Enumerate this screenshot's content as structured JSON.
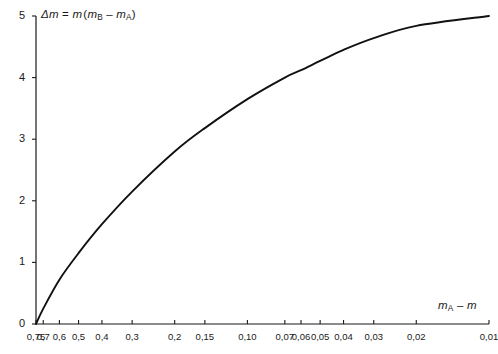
{
  "chart_data": {
    "type": "line",
    "title": "",
    "ylabel": "Δm = m (mB − mA)",
    "xlabel": "mA − m",
    "xscale": "log",
    "x_reversed": true,
    "xlim": [
      0.75,
      0.01
    ],
    "ylim": [
      0,
      5
    ],
    "grid": false,
    "legend": null,
    "xtick_labels": [
      "0,75",
      "0,7",
      "0,6",
      "0,5",
      "0,4",
      "0,3",
      "0,2",
      "0,15",
      "0,10",
      "0,07",
      "0,06",
      "0,05",
      "0,04",
      "0,03",
      "0,02",
      "0,01"
    ],
    "xtick_values": [
      0.75,
      0.7,
      0.6,
      0.5,
      0.4,
      0.3,
      0.2,
      0.15,
      0.1,
      0.07,
      0.06,
      0.05,
      0.04,
      0.03,
      0.02,
      0.01
    ],
    "ytick_labels": [
      "0",
      "1",
      "2",
      "3",
      "4",
      "5"
    ],
    "ytick_values": [
      0,
      1,
      2,
      3,
      4,
      5
    ],
    "series": [
      {
        "name": "Δm",
        "color": "#111111",
        "x": [
          0.75,
          0.7,
          0.6,
          0.5,
          0.4,
          0.3,
          0.2,
          0.15,
          0.1,
          0.07,
          0.06,
          0.05,
          0.04,
          0.03,
          0.02,
          0.01
        ],
        "y": [
          0.0,
          0.25,
          0.72,
          1.15,
          1.62,
          2.15,
          2.8,
          3.18,
          3.65,
          4.0,
          4.12,
          4.27,
          4.45,
          4.64,
          4.84,
          5.0
        ]
      }
    ]
  },
  "axis_labels": {
    "y_axis_caption": "Δm = m (mB − mA)",
    "x_axis_caption": "mA − m"
  }
}
